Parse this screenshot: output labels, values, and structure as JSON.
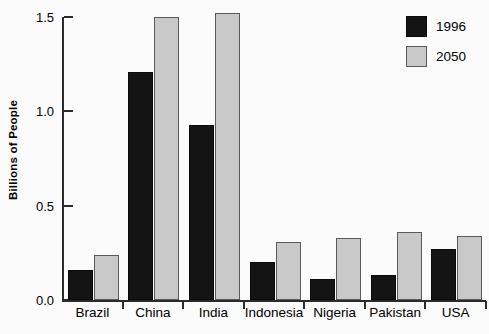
{
  "chart_data": {
    "type": "bar",
    "title": "",
    "xlabel": "",
    "ylabel": "Billions of People",
    "ylim": [
      0.0,
      1.5
    ],
    "yticks": [
      0.0,
      0.5,
      1.0,
      1.5
    ],
    "ytick_labels": [
      "0.0",
      "0.5",
      "1.0",
      "1.5"
    ],
    "grid": false,
    "legend_position": "top-right",
    "categories": [
      "Brazil",
      "China",
      "India",
      "Indonesia",
      "Nigeria",
      "Pakistan",
      "USA"
    ],
    "series": [
      {
        "name": "1996",
        "color": "#141414",
        "values": [
          0.16,
          1.21,
          0.93,
          0.2,
          0.11,
          0.13,
          0.27
        ]
      },
      {
        "name": "2050",
        "color": "#c9c9c9",
        "values": [
          0.24,
          1.5,
          1.52,
          0.31,
          0.33,
          0.36,
          0.34
        ]
      }
    ]
  },
  "legend": {
    "entries": [
      {
        "label": "1996",
        "swatch": "black-square-swatch"
      },
      {
        "label": "2050",
        "swatch": "gray-square-swatch"
      }
    ]
  }
}
